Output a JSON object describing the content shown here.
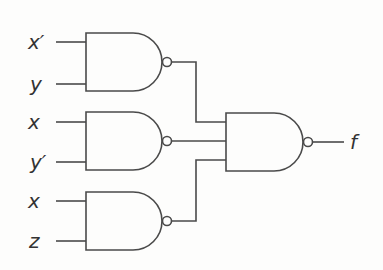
{
  "diagram": {
    "type": "logic-circuit",
    "gate_type": "NAND",
    "inputs": [
      {
        "label": "x′",
        "y": 42
      },
      {
        "label": "y",
        "y": 84
      },
      {
        "label": "x",
        "y": 122
      },
      {
        "label": "y′",
        "y": 162
      },
      {
        "label": "x",
        "y": 201
      },
      {
        "label": "z",
        "y": 241
      }
    ],
    "gates": [
      {
        "id": "nand-1",
        "inputs": [
          "x′",
          "y"
        ],
        "top": 33,
        "bottom": 91
      },
      {
        "id": "nand-2",
        "inputs": [
          "x",
          "y′"
        ],
        "top": 112,
        "bottom": 170
      },
      {
        "id": "nand-3",
        "inputs": [
          "x",
          "z"
        ],
        "top": 192,
        "bottom": 250
      },
      {
        "id": "nand-out",
        "inputs": [
          "nand-1",
          "nand-2",
          "nand-3"
        ],
        "top": 113,
        "bottom": 171
      }
    ],
    "output": {
      "label": "f"
    },
    "colors": {
      "line": "#4a4a4a",
      "background": "#fdfdfc"
    }
  }
}
